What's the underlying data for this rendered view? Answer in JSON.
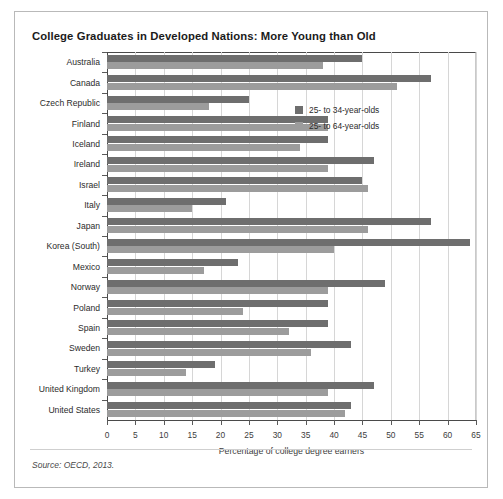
{
  "title": "College Graduates in Developed Nations: More Young than Old",
  "source": "Source: OECD, 2013.",
  "legend": {
    "items": [
      {
        "label": "25- to 34-year-olds",
        "color": "#6e6e6e",
        "key": "young"
      },
      {
        "label": "25- to 64-year-olds",
        "color": "#9c9c9c",
        "key": "all"
      }
    ]
  },
  "chart_data": {
    "type": "bar",
    "orientation": "horizontal",
    "title": "College Graduates in Developed Nations: More Young than Old",
    "xlabel": "Percentage of college degree earners",
    "ylabel": "",
    "xlim": [
      0,
      65
    ],
    "xticks": [
      0,
      5,
      10,
      15,
      20,
      25,
      30,
      35,
      40,
      45,
      50,
      55,
      60,
      65
    ],
    "grid": true,
    "legend_position": "inside-upper-right",
    "categories": [
      "Australia",
      "Canada",
      "Czech Republic",
      "Finland",
      "Iceland",
      "Ireland",
      "Israel",
      "Italy",
      "Japan",
      "Korea (South)",
      "Mexico",
      "Norway",
      "Poland",
      "Spain",
      "Sweden",
      "Turkey",
      "United Kingdom",
      "United States"
    ],
    "series": [
      {
        "name": "25- to 34-year-olds",
        "color": "#6e6e6e",
        "values": [
          45,
          57,
          25,
          39,
          39,
          47,
          45,
          21,
          57,
          64,
          23,
          49,
          39,
          39,
          43,
          19,
          47,
          43
        ]
      },
      {
        "name": "25- to 64-year-olds",
        "color": "#9c9c9c",
        "values": [
          38,
          51,
          18,
          39,
          34,
          39,
          46,
          15,
          46,
          40,
          17,
          39,
          24,
          32,
          36,
          14,
          39,
          42
        ]
      }
    ]
  }
}
